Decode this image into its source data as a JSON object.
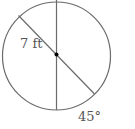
{
  "diagram": {
    "type": "circle-geometry",
    "labels": {
      "radius": "7 ft",
      "angle": "45°"
    },
    "colors": {
      "stroke": "#6b6b6b",
      "text": "#555555",
      "center_dot": "#000000"
    }
  }
}
